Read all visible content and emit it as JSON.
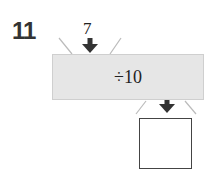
{
  "question": {
    "number": "11",
    "input_value": "7",
    "operation": "÷10",
    "answer": ""
  },
  "colors": {
    "box_fill": "#e6e6e6",
    "arrow": "#333333",
    "lines": "#bbbbbb"
  }
}
